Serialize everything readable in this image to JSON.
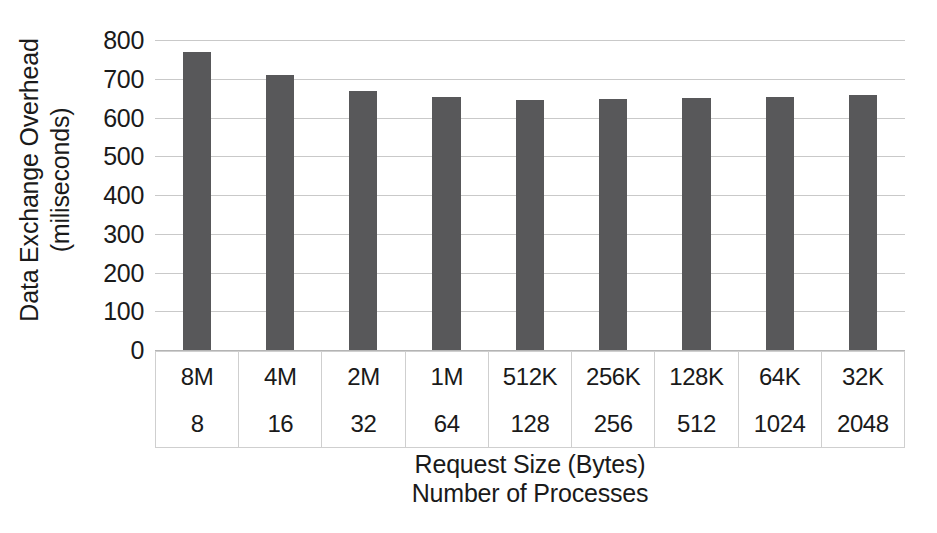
{
  "chart_data": {
    "type": "bar",
    "title": "",
    "categories": [
      "8M",
      "4M",
      "2M",
      "1M",
      "512K",
      "256K",
      "128K",
      "64K",
      "32K"
    ],
    "secondary_categories": [
      "8",
      "16",
      "32",
      "64",
      "128",
      "256",
      "512",
      "1024",
      "2048"
    ],
    "values": [
      770,
      710,
      668,
      653,
      645,
      647,
      650,
      652,
      657
    ],
    "series": [
      {
        "name": "Data Exchange Overhead",
        "values": [
          770,
          710,
          668,
          653,
          645,
          647,
          650,
          652,
          657
        ]
      }
    ],
    "xlabel": "Request Size (Bytes)",
    "xlabel2": "Number of Processes",
    "ylabel": "Data Exchange Overhead",
    "ylabel2": "(miliseconds)",
    "ylim": [
      0,
      800
    ],
    "ytick_step": 100,
    "yticks": [
      "800",
      "700",
      "600",
      "500",
      "400",
      "300",
      "200",
      "100",
      "0"
    ],
    "ytick_values": [
      800,
      700,
      600,
      500,
      400,
      300,
      200,
      100,
      0
    ],
    "grid": true,
    "legend": false,
    "bar_color": "#58585a",
    "gridline_color": "#c9c9c9",
    "background_color": "#ffffff"
  },
  "axes": {
    "y_title_line1": "Data Exchange Overhead",
    "y_title_line2": "(miliseconds)",
    "x_title_line1": "Request Size (Bytes)",
    "x_title_line2": "Number of Processes"
  },
  "category_table": {
    "row_request_size": [
      "8M",
      "4M",
      "2M",
      "1M",
      "512K",
      "256K",
      "128K",
      "64K",
      "32K"
    ],
    "row_num_processes": [
      "8",
      "16",
      "32",
      "64",
      "128",
      "256",
      "512",
      "1024",
      "2048"
    ]
  }
}
